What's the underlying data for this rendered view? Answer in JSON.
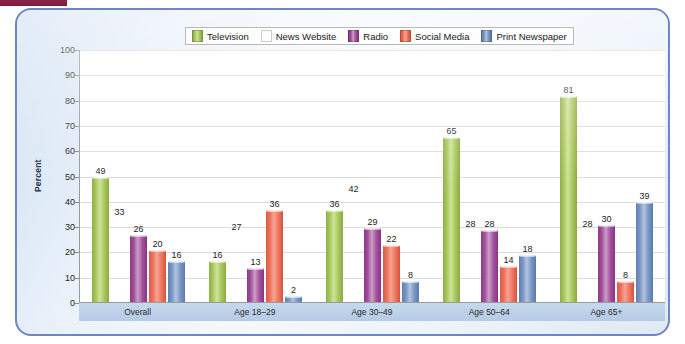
{
  "chart_data": {
    "type": "bar",
    "title": "",
    "xlabel": "",
    "ylabel": "Percent",
    "ylim": [
      0,
      100
    ],
    "ytick_step": 10,
    "yticks": [
      "100",
      "90",
      "80",
      "70",
      "60",
      "50",
      "40",
      "30",
      "20",
      "10",
      "0"
    ],
    "grid": true,
    "legend_position": "top",
    "categories": [
      "Overall",
      "Age 18–29",
      "Age 30–49",
      "Age 50–64",
      "Age 65+"
    ],
    "series": [
      {
        "name": "Television",
        "color": "#a7c75c",
        "values": [
          49,
          16,
          36,
          65,
          81
        ]
      },
      {
        "name": "News Website",
        "color": "#f59d42",
        "values": [
          33,
          27,
          42,
          28,
          28
        ]
      },
      {
        "name": "Radio",
        "color": "#a24e9b",
        "values": [
          26,
          13,
          29,
          28,
          30
        ]
      },
      {
        "name": "Social Media",
        "color": "#ec7059",
        "values": [
          20,
          36,
          22,
          14,
          8
        ]
      },
      {
        "name": "Print Newspaper",
        "color": "#7794c2",
        "values": [
          16,
          2,
          8,
          18,
          39
        ]
      }
    ]
  },
  "decor": {
    "top_strip_color": "#8f2246",
    "frame_border_color": "#6f86c4",
    "axis_band_color": "#b5cbe4"
  }
}
